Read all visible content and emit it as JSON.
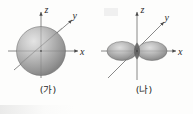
{
  "figure": {
    "background_color": "#fdfdfc",
    "axis_color": "#4a4a4a",
    "label_color": "#2b2b2b"
  },
  "panels": [
    {
      "id": "a",
      "caption": "(가)",
      "orbital": {
        "name": "s-orbital",
        "shape": "sphere",
        "fill_light": "#d8d8d8",
        "fill_mid": "#a8a8a8",
        "fill_dark": "#808080",
        "outline": "#6e6e6e"
      },
      "axes": [
        {
          "name": "z",
          "label": "z",
          "direction": "up"
        },
        {
          "name": "y",
          "label": "y",
          "direction": "diagonal-up-right"
        },
        {
          "name": "x",
          "label": "x",
          "direction": "right"
        }
      ]
    },
    {
      "id": "b",
      "caption": "(나)",
      "orbital": {
        "name": "p-orbital",
        "shape": "dumbbell",
        "lobes": 2,
        "axis_of_lobes": "x",
        "fill_light": "#d4d4d4",
        "fill_mid": "#a6a6a6",
        "fill_dark": "#7e7e7e",
        "outline": "#6e6e6e"
      },
      "axes": [
        {
          "name": "z",
          "label": "z",
          "direction": "up"
        },
        {
          "name": "y",
          "label": "y",
          "direction": "diagonal-up-right"
        },
        {
          "name": "x",
          "label": "x",
          "direction": "right"
        }
      ]
    }
  ]
}
